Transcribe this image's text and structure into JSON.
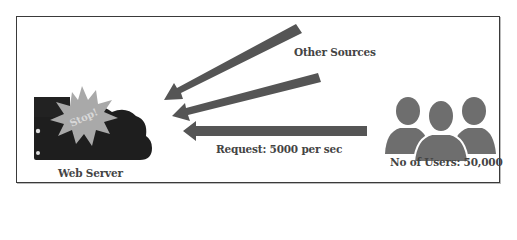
{
  "diagram": {
    "labels": {
      "web_server": "Web Server",
      "stop": "Stop!",
      "other_sources": "Other Sources",
      "request": "Request: 5000 per sec",
      "users": "No of Users: 50,000"
    },
    "icons": {
      "server": "cloud-server-icon",
      "stop_burst": "starburst-icon",
      "users": "users-group-icon",
      "arrows": [
        "arrow-left-icon",
        "arrow-left-icon",
        "arrow-left-icon"
      ]
    },
    "colors": {
      "server": "#1e1e1e",
      "starburst": "#a9a9a9",
      "arrow": "#555555",
      "users": "#6e6e6e",
      "text": "#444444",
      "frame": "#3a3a3a"
    }
  }
}
